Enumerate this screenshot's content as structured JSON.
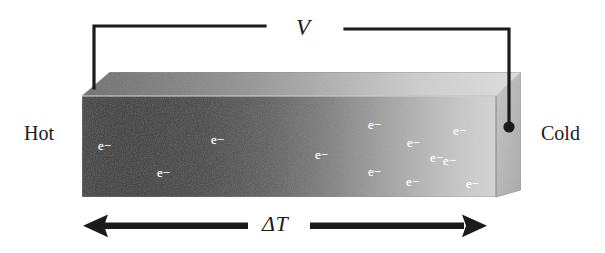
{
  "figure": {
    "title_visible": false,
    "width": 605,
    "height": 253,
    "background_color": "#ffffff",
    "ink_color": "#1b1b1b",
    "electron_color": "#ffffff"
  },
  "labels": {
    "hot": "Hot",
    "cold": "Cold",
    "voltage": "V",
    "temperature_difference": "ΔT"
  },
  "electron_symbol": "e−",
  "electrons": [
    {
      "id": "e1",
      "x": 98,
      "y": 139,
      "region": "hot"
    },
    {
      "id": "e2",
      "x": 157,
      "y": 166,
      "region": "hot"
    },
    {
      "id": "e3",
      "x": 211,
      "y": 133,
      "region": "hot"
    },
    {
      "id": "e4",
      "x": 315,
      "y": 148,
      "region": "middle"
    },
    {
      "id": "e5",
      "x": 368,
      "y": 118,
      "region": "cold"
    },
    {
      "id": "e6",
      "x": 407,
      "y": 136,
      "region": "cold"
    },
    {
      "id": "e7",
      "x": 368,
      "y": 165,
      "region": "cold"
    },
    {
      "id": "e8",
      "x": 406,
      "y": 175,
      "region": "cold"
    },
    {
      "id": "e9",
      "x": 430,
      "y": 151,
      "region": "cold"
    },
    {
      "id": "e10",
      "x": 453,
      "y": 124,
      "region": "cold"
    },
    {
      "id": "e11",
      "x": 443,
      "y": 154,
      "region": "cold"
    },
    {
      "id": "e12",
      "x": 466,
      "y": 177,
      "region": "cold"
    }
  ],
  "block": {
    "description": "Thermoelectric bar with thermal gradient from hot (dark) to cold (light)",
    "front_face": {
      "gradient_from": "#3a3a3a",
      "gradient_to": "#d8d8d8"
    },
    "top_face": {
      "gradient_from": "#6a6a6a",
      "gradient_to": "#e2e2e2"
    },
    "side_face": {
      "color": "#bdbdbd"
    }
  },
  "wiring": {
    "description": "Voltmeter leads from hot end to cold end across the bar",
    "left_lead_top_y": 25,
    "right_lead_top_y": 30,
    "terminal_dot": {
      "x": 509,
      "y": 127,
      "r": 5.5
    },
    "wire_color": "#1b1b1b"
  },
  "arrows": {
    "left_arrow": {
      "from_x": 248,
      "to_x": 83,
      "y": 226,
      "direction": "left"
    },
    "right_arrow": {
      "from_x": 310,
      "to_x": 487,
      "y": 226,
      "direction": "right"
    },
    "color": "#1b1b1b"
  }
}
